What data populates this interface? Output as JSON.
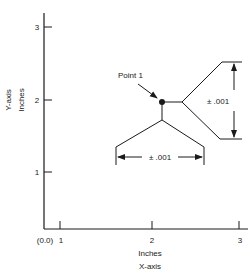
{
  "diagram": {
    "y_axis": {
      "title": "Y-axis",
      "unit": "Inches",
      "ticks": [
        "1",
        "2",
        "3"
      ]
    },
    "x_axis": {
      "title": "X-axis",
      "unit": "Inches",
      "origin_label": "(0.0)",
      "ticks": [
        "1",
        "2",
        "3"
      ]
    },
    "point": {
      "label": "Point 1",
      "x": 2,
      "y": 2
    },
    "tolerances": {
      "vertical": "± .001",
      "horizontal": "± .001"
    },
    "colors": {
      "ink": "#1a1a1a",
      "background": "#ffffff"
    }
  }
}
